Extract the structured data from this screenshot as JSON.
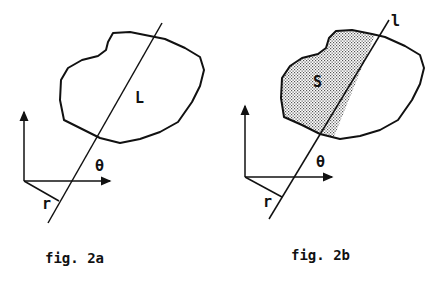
{
  "figures": [
    {
      "id": "2a",
      "caption": "fig. 2a",
      "region_label": "L",
      "angle_label": "θ",
      "distance_label": "r",
      "shaded": false
    },
    {
      "id": "2b",
      "caption": "fig. 2b",
      "region_label": "S",
      "angle_label": "θ",
      "distance_label": "r",
      "line_label": "l",
      "shaded": true
    }
  ]
}
